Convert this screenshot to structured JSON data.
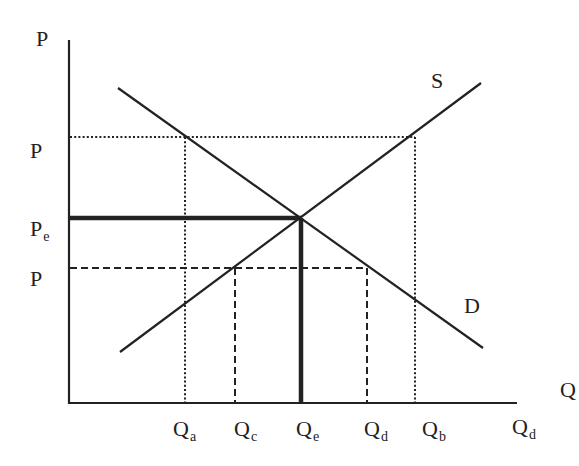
{
  "diagram": {
    "type": "supply-demand",
    "colors": {
      "ink": "#222222",
      "background": "#ffffff"
    },
    "axes": {
      "y_label": "P",
      "x_label": "Q",
      "origin": [
        69,
        403
      ],
      "y_top": 40,
      "x_right": 517
    },
    "curves": {
      "supply": {
        "label": "S",
        "from": [
          120,
          352
        ],
        "to": [
          481,
          83
        ]
      },
      "demand": {
        "label": "D",
        "from": [
          118,
          88
        ],
        "to": [
          483,
          348
        ]
      }
    },
    "equilibrium": {
      "x": 301,
      "y": 218,
      "price_label": "P",
      "price_sub": "e",
      "qty_label": "Q",
      "qty_sub": "e"
    },
    "price_levels": [
      {
        "id": "high-price",
        "label": "P",
        "sub": "",
        "y": 137,
        "style": "dotted"
      },
      {
        "id": "equilibrium-price",
        "label": "P",
        "sub": "e",
        "y": 218,
        "style": "thick"
      },
      {
        "id": "low-price",
        "label": "P",
        "sub": "",
        "y": 268,
        "style": "dashed"
      }
    ],
    "quantity_ticks": [
      {
        "id": "qa",
        "label": "Q",
        "sub": "a",
        "x": 185,
        "style": "dotted"
      },
      {
        "id": "qc",
        "label": "Q",
        "sub": "c",
        "x": 235,
        "style": "dashed"
      },
      {
        "id": "qe",
        "label": "Q",
        "sub": "e",
        "x": 301,
        "style": "thick"
      },
      {
        "id": "qd",
        "label": "Q",
        "sub": "d",
        "x": 367,
        "style": "dashed"
      },
      {
        "id": "qb",
        "label": "Q",
        "sub": "b",
        "x": 415,
        "style": "dotted"
      },
      {
        "id": "qd-axis",
        "label": "Q",
        "sub": "d",
        "x": 520,
        "style": "none"
      }
    ]
  },
  "labels": {
    "y_axis": "P",
    "x_axis": "Q",
    "supply": "S",
    "demand": "D",
    "p_high": "P",
    "p_eq": "P",
    "p_eq_sub": "e",
    "p_low": "P",
    "qa": "Q",
    "qa_sub": "a",
    "qc": "Q",
    "qc_sub": "c",
    "qe": "Q",
    "qe_sub": "e",
    "qd": "Q",
    "qd_sub": "d",
    "qb": "Q",
    "qb_sub": "b",
    "qd2": "Q",
    "qd2_sub": "d"
  }
}
